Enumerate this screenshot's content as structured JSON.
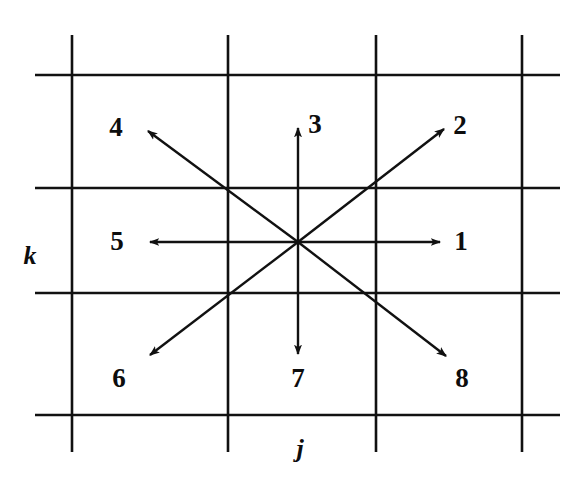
{
  "figure": {
    "caption": "",
    "background_color": "#ffffff",
    "ink_color": "#111111",
    "width": 584,
    "height": 483
  },
  "chart_data": {
    "type": "diagram",
    "title": "",
    "xlabel": "j",
    "ylabel": "k",
    "grid": {
      "on": true,
      "vertical_lines_x": [
        72,
        228,
        376,
        522
      ],
      "horizontal_lines_y": [
        75,
        188,
        293,
        415
      ],
      "vertical_span_y": [
        35,
        452
      ],
      "horizontal_span_x": [
        35,
        560
      ],
      "line_color": "#111111",
      "line_width": 2.6
    },
    "center": {
      "x": 298,
      "y": 242
    },
    "arrows": [
      {
        "label": "1",
        "direction": "east",
        "dx": 1,
        "dy": 0,
        "tip_x": 440,
        "tip_y": 242,
        "label_x": 461,
        "label_y": 241
      },
      {
        "label": "2",
        "direction": "north-east",
        "dx": 1,
        "dy": 1,
        "tip_x": 444,
        "tip_y": 129,
        "label_x": 460,
        "label_y": 125
      },
      {
        "label": "3",
        "direction": "north",
        "dx": 0,
        "dy": 1,
        "tip_x": 298,
        "tip_y": 128,
        "label_x": 315,
        "label_y": 124
      },
      {
        "label": "4",
        "direction": "north-west",
        "dx": -1,
        "dy": 1,
        "tip_x": 148,
        "tip_y": 131,
        "label_x": 116,
        "label_y": 127
      },
      {
        "label": "5",
        "direction": "west",
        "dx": -1,
        "dy": 0,
        "tip_x": 150,
        "tip_y": 242,
        "label_x": 117,
        "label_y": 241
      },
      {
        "label": "6",
        "direction": "south-west",
        "dx": -1,
        "dy": -1,
        "tip_x": 150,
        "tip_y": 355,
        "label_x": 119,
        "label_y": 378
      },
      {
        "label": "7",
        "direction": "south",
        "dx": 0,
        "dy": -1,
        "tip_x": 298,
        "tip_y": 354,
        "label_x": 298,
        "label_y": 378
      },
      {
        "label": "8",
        "direction": "south-east",
        "dx": 1,
        "dy": -1,
        "tip_x": 446,
        "tip_y": 356,
        "label_x": 462,
        "label_y": 378
      }
    ],
    "axis_labels": [
      {
        "text": "k",
        "x": 30,
        "y": 256,
        "axis": "vertical"
      },
      {
        "text": "j",
        "x": 300,
        "y": 449,
        "axis": "horizontal"
      }
    ]
  }
}
